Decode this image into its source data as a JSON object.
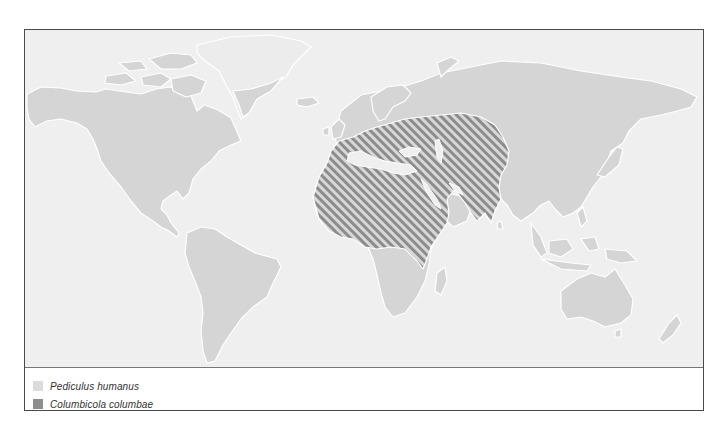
{
  "map": {
    "title": "",
    "colors": {
      "ocean": "#efefef",
      "land": "#d5d5d5",
      "coast": "#ffffff",
      "ice": "#ececec",
      "hatch_dark": "#8c8c8c",
      "hatch_light": "#dadada"
    }
  },
  "legend": {
    "items": [
      {
        "label": "Pediculus humanus",
        "swatch_color": "#dcdcdc"
      },
      {
        "label": "Columbicola columbae",
        "swatch_color": "#8e8e8e"
      }
    ]
  }
}
